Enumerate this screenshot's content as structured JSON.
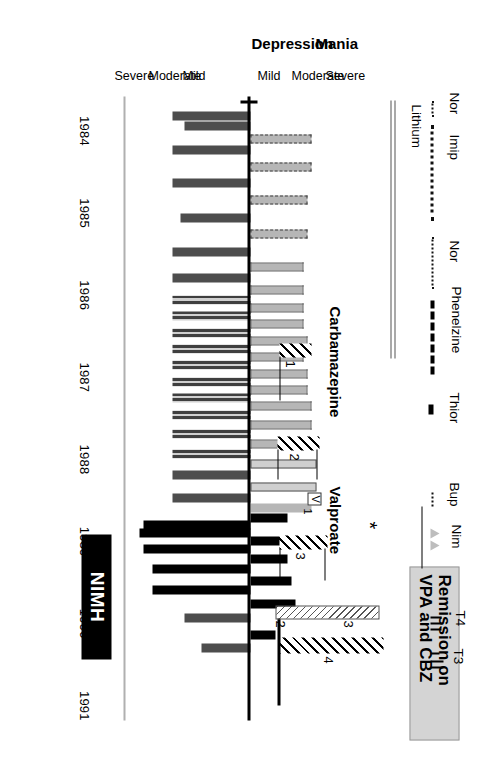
{
  "figure": {
    "kind": "life-chart",
    "orientation_note": "chart rendered rotated 90 degrees clockwise"
  },
  "axes": {
    "mania_axis_label": "Mania",
    "depression_axis_label": "Depression",
    "mania_levels": [
      "Severe",
      "Moderate",
      "Mild"
    ],
    "depression_levels": [
      "Mild",
      "Moderate",
      "Severe"
    ],
    "years": [
      "1984",
      "1985",
      "1986",
      "1987",
      "1988",
      "1989",
      "1990",
      "1991"
    ]
  },
  "annotations": {
    "nimh_label": "NIMH",
    "remission_label": "Remission on\nVPA and CBZ",
    "asterisk": "*"
  },
  "drugs": [
    {
      "name": "Nor",
      "style": "dot-short"
    },
    {
      "name": "Imip",
      "style": "dot"
    },
    {
      "name": "Lithium",
      "style": "double-solid"
    },
    {
      "name": "Nor",
      "style": "dot"
    },
    {
      "name": "Phenelzine",
      "style": "dash-dot"
    },
    {
      "name": "Thior",
      "style": "thick-short"
    },
    {
      "name": "Bup",
      "style": "dot-short"
    },
    {
      "name": "Nim",
      "style": "triangles"
    },
    {
      "name": "T4",
      "style": "ticks"
    },
    {
      "name": "T3",
      "style": "ticks"
    }
  ],
  "trials": {
    "carbamazepine_label": "Carbamazepine",
    "valproate_label": "Valproate",
    "valproate_legend_symbol": "V",
    "valproate_legend_sub": "1",
    "carbamazepine_numbers": [
      "1",
      "2",
      "3",
      "4"
    ],
    "valproate_numbers": [
      "2",
      "3"
    ]
  },
  "chart_data": {
    "type": "bar",
    "title": "",
    "xlabel": "",
    "ylabel": "Mania / Depression severity",
    "x": [
      "1984",
      "1985",
      "1986",
      "1987",
      "1988",
      "1989",
      "1990",
      "1991"
    ],
    "xlim": [
      1984,
      1991.6
    ],
    "ylim": [
      -3,
      3
    ],
    "grid": false,
    "legend": "none",
    "series": [
      {
        "name": "Mania",
        "direction": "up",
        "note": "light grey bars above the baseline, severity 0 to 3"
      },
      {
        "name": "Depression",
        "direction": "down",
        "note": "dark grey / black bars below the baseline, severity 0 to 3"
      }
    ],
    "episodes": [
      {
        "t": 1984.18,
        "mania": 0.0,
        "dep": 1.9,
        "fill": "dark"
      },
      {
        "t": 1984.3,
        "mania": 0.0,
        "dep": 1.6,
        "fill": "dark"
      },
      {
        "t": 1984.46,
        "mania": 1.5,
        "dep": 0.0,
        "fill": "light-dash"
      },
      {
        "t": 1984.6,
        "mania": 0.0,
        "dep": 1.9,
        "fill": "dark"
      },
      {
        "t": 1984.8,
        "mania": 1.5,
        "dep": 0.0,
        "fill": "light-dash"
      },
      {
        "t": 1985.0,
        "mania": 0.0,
        "dep": 1.9,
        "fill": "dark"
      },
      {
        "t": 1985.2,
        "mania": 1.4,
        "dep": 0.0,
        "fill": "light-dash"
      },
      {
        "t": 1985.42,
        "mania": 0.0,
        "dep": 1.7,
        "fill": "dark"
      },
      {
        "t": 1985.62,
        "mania": 1.4,
        "dep": 0.0,
        "fill": "light-dash"
      },
      {
        "t": 1985.84,
        "mania": 0.0,
        "dep": 1.9,
        "fill": "dark"
      },
      {
        "t": 1986.02,
        "mania": 1.3,
        "dep": 0.0,
        "fill": "light-dot"
      },
      {
        "t": 1986.16,
        "mania": 0.0,
        "dep": 1.9,
        "fill": "dark"
      },
      {
        "t": 1986.3,
        "mania": 1.3,
        "dep": 0.0,
        "fill": "light-dot"
      },
      {
        "t": 1986.42,
        "mania": 0.0,
        "dep": 1.9,
        "fill": "dark-dot"
      },
      {
        "t": 1986.52,
        "mania": 1.3,
        "dep": 0.0,
        "fill": "light-dot"
      },
      {
        "t": 1986.62,
        "mania": 0.0,
        "dep": 1.9,
        "fill": "dark-dot"
      },
      {
        "t": 1986.72,
        "mania": 1.3,
        "dep": 0.0,
        "fill": "light-dot"
      },
      {
        "t": 1986.82,
        "mania": 0.0,
        "dep": 1.9,
        "fill": "dark-dot"
      },
      {
        "t": 1986.92,
        "mania": 1.4,
        "dep": 0.0,
        "fill": "light-dot"
      },
      {
        "t": 1987.02,
        "mania": 0.0,
        "dep": 1.9,
        "fill": "dark-dot"
      },
      {
        "t": 1987.12,
        "mania": 1.3,
        "dep": 0.0,
        "fill": "light-dot"
      },
      {
        "t": 1987.22,
        "mania": 0.0,
        "dep": 1.9,
        "fill": "dark-dot"
      },
      {
        "t": 1987.32,
        "mania": 1.4,
        "dep": 0.0,
        "fill": "light-dot"
      },
      {
        "t": 1987.42,
        "mania": 0.0,
        "dep": 1.9,
        "fill": "dark-dot"
      },
      {
        "t": 1987.52,
        "mania": 1.4,
        "dep": 0.0,
        "fill": "light-dot"
      },
      {
        "t": 1987.62,
        "mania": 0.0,
        "dep": 1.9,
        "fill": "dark-dot"
      },
      {
        "t": 1987.72,
        "mania": 1.5,
        "dep": 0.0,
        "fill": "light-dot"
      },
      {
        "t": 1987.82,
        "mania": 0.0,
        "dep": 1.9,
        "fill": "dark-dot"
      },
      {
        "t": 1987.94,
        "mania": 1.5,
        "dep": 0.0,
        "fill": "light-dot"
      },
      {
        "t": 1988.06,
        "mania": 0.0,
        "dep": 1.9,
        "fill": "dark-dot"
      },
      {
        "t": 1988.18,
        "mania": 1.5,
        "dep": 0.0,
        "fill": "light-dot"
      },
      {
        "t": 1988.3,
        "mania": 0.0,
        "dep": 1.9,
        "fill": "dark-dot"
      },
      {
        "t": 1988.42,
        "mania": 1.6,
        "dep": 0.0,
        "fill": "light-open"
      },
      {
        "t": 1988.56,
        "mania": 0.0,
        "dep": 1.9,
        "fill": "dark"
      },
      {
        "t": 1988.7,
        "mania": 1.6,
        "dep": 0.0,
        "fill": "light-open"
      },
      {
        "t": 1988.84,
        "mania": 0.0,
        "dep": 1.9,
        "fill": "dark"
      },
      {
        "t": 1988.96,
        "mania": 1.5,
        "dep": 0.0,
        "fill": "light"
      },
      {
        "t": 1989.08,
        "mania": 0.9,
        "dep": 0.0,
        "fill": "black"
      },
      {
        "t": 1989.16,
        "mania": 0.0,
        "dep": 2.6,
        "fill": "black"
      },
      {
        "t": 1989.26,
        "mania": 0.0,
        "dep": 2.7,
        "fill": "black"
      },
      {
        "t": 1989.36,
        "mania": 0.8,
        "dep": 0.0,
        "fill": "black"
      },
      {
        "t": 1989.46,
        "mania": 0.0,
        "dep": 2.6,
        "fill": "black"
      },
      {
        "t": 1989.58,
        "mania": 0.9,
        "dep": 0.0,
        "fill": "black"
      },
      {
        "t": 1989.7,
        "mania": 0.0,
        "dep": 2.4,
        "fill": "black"
      },
      {
        "t": 1989.84,
        "mania": 1.0,
        "dep": 0.0,
        "fill": "black"
      },
      {
        "t": 1989.96,
        "mania": 0.0,
        "dep": 2.4,
        "fill": "black"
      },
      {
        "t": 1990.12,
        "mania": 1.1,
        "dep": 0.0,
        "fill": "black"
      },
      {
        "t": 1990.3,
        "mania": 0.0,
        "dep": 1.6,
        "fill": "dark"
      },
      {
        "t": 1990.5,
        "mania": 0.6,
        "dep": 0.0,
        "fill": "black"
      },
      {
        "t": 1990.66,
        "mania": 0.0,
        "dep": 1.2,
        "fill": "dark"
      }
    ]
  }
}
